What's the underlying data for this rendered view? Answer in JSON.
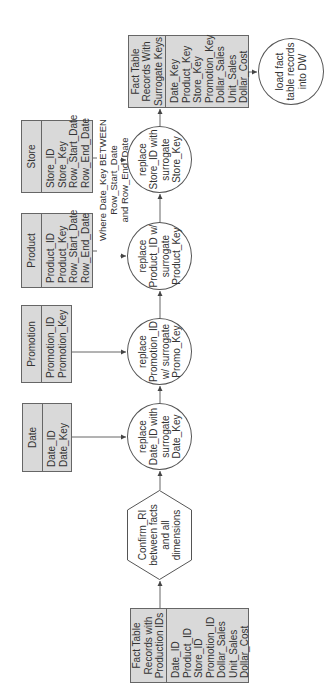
{
  "diagram": {
    "title": "",
    "orientation": "rotated-90-ccw",
    "source_table": {
      "header": "Fact Table\nRecords with\nProduction IDs",
      "fields": [
        "Date_ID",
        "Product_ID",
        "Store_ID",
        "Promotion_ID",
        "Dollar_Sales",
        "Unit_Sales",
        "Dollar_Cost"
      ]
    },
    "confirm_step": {
      "label": "Confirm_RI\nbetween facts\nand all\ndimensions"
    },
    "dimensions": [
      {
        "name": "Date",
        "fields": [
          "Date_ID",
          "Date_Key"
        ]
      },
      {
        "name": "Promotion",
        "fields": [
          "Promotion_ID",
          "Promotion_Key"
        ]
      },
      {
        "name": "Product",
        "fields": [
          "Product_ID",
          "Product_Key",
          "Row_Start_Date",
          "Row_End_Date"
        ]
      },
      {
        "name": "Store",
        "fields": [
          "Store_ID",
          "Store_Key",
          "Row_Start_Date",
          "Row_End_Date"
        ]
      }
    ],
    "replace_steps": [
      {
        "label": "replace\nDate_ID with\nsurrogate\nDate_Key"
      },
      {
        "label": "replace\nPromotion_ID\nw/ surrogate\nPromo_Key"
      },
      {
        "label": "replace\nProduct_ID w/\nsurrogate\nProduct_Key"
      },
      {
        "label": "replace\nStore_ID with\nsurrogate\nStore_Key"
      }
    ],
    "annotation": "Where Date_Key BETWEEN Row_Start_Date\nand Row_End_Date",
    "result_table": {
      "header": "Fact Table\nRecords With\nSurrogate Keys",
      "fields": [
        "Date_Key",
        "Product_Key",
        "Store_Key",
        "Promotion_Key",
        "Dollar_Sales",
        "Unit_Sales",
        "Dollar_Cost"
      ]
    },
    "load_step": {
      "label": "load fact\ntable records\ninto DW"
    },
    "colors": {
      "table_fill": "#d9d9d9",
      "stroke": "#555555",
      "text": "#333333"
    }
  }
}
